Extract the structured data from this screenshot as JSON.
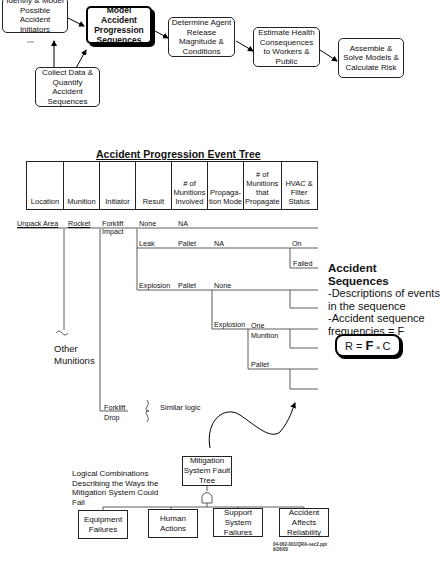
{
  "flow": {
    "boxes": [
      {
        "id": "initiators",
        "text": "Identify & Model Possible Accident Initiators"
      },
      {
        "id": "progression",
        "text": "Model Accident Progression Sequences"
      },
      {
        "id": "release",
        "text": "Determine Agent Release Magnitude & Conditions"
      },
      {
        "id": "health",
        "text": "Estimate Health Consequences to Workers & Public"
      },
      {
        "id": "risk",
        "text": "Assemble & Solve Models & Calculate Risk"
      },
      {
        "id": "data",
        "text": "Collect Data & Quantify Accident Sequences"
      }
    ]
  },
  "event_tree": {
    "title": "Accident Progression Event Tree",
    "columns": [
      "Location",
      "Munition",
      "Initiator",
      "Result",
      "# of Munitions Involved",
      "Propaga-tion Mode",
      "# of Munitions that Propagate",
      "HVAC & Filter Status"
    ],
    "labels": {
      "location": "Unpack Area",
      "munition": "Rocket",
      "initiator_1": "Forklift Impact",
      "initiator_2": "Forklift Drop",
      "result_none": "None",
      "result_leak": "Leak",
      "result_explosion": "Explosion",
      "na_1": "NA",
      "pallet_leak": "Pallet",
      "na_2": "NA",
      "hvac_on": "On",
      "hvac_failed": "Failed",
      "pallet_explosion": "Pallet",
      "prop_none": "None",
      "prop_explosion": "Explosion",
      "one_munition": "One Munition",
      "pallet_prop": "Pallet",
      "other_munitions": "Other Munitions",
      "similar_logic": "Similar logic"
    }
  },
  "accident_sequences": {
    "heading": "Accident Sequences",
    "line1": "-Descriptions of events in the sequence",
    "line2": "-Accident sequence frequencies = F",
    "equation": {
      "r": "R = ",
      "f": "F",
      "x": " × ",
      "c": "C"
    }
  },
  "fault_tree": {
    "note": "Logical Combinations Describing the Ways the Mitigation System Could Fail",
    "top": "Mitigation System Fault Tree",
    "children": [
      "Equipment Failures",
      "Human Actions",
      "Support System Failures",
      "Accident Affects Reliability"
    ]
  },
  "footer": {
    "file": "04-062-001/QRA-sec2.ppt",
    "date": "9/26/00"
  }
}
